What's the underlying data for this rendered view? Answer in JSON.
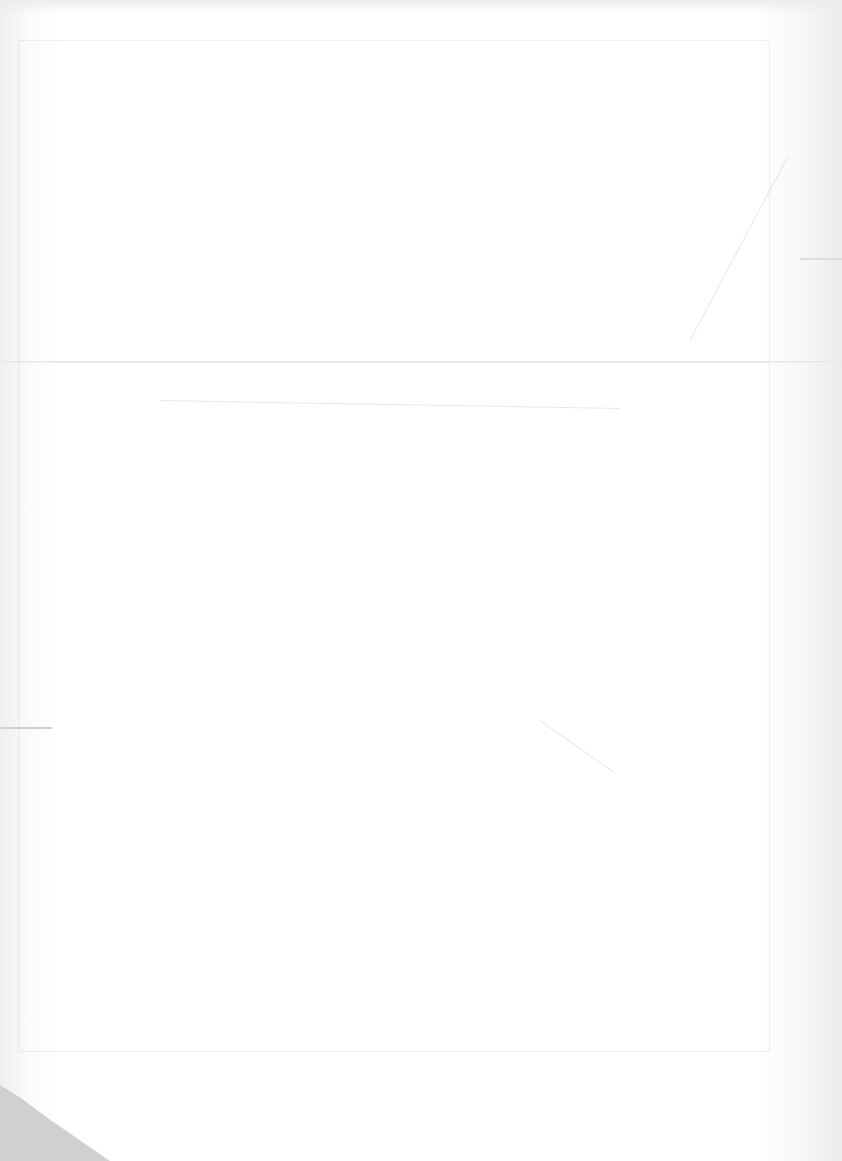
{
  "document": {
    "type": "scanned-blank-page",
    "visible_text": [],
    "features": {
      "fold_line": "horizontal",
      "bleed_through": "faint map outline",
      "corner_shadow": "bottom-left"
    }
  }
}
